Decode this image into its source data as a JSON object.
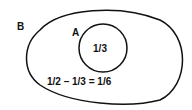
{
  "diagram": {
    "outer_set": {
      "label": "B"
    },
    "inner_set": {
      "label": "A",
      "value": "1/3"
    },
    "equation": "1/2 – 1/3 = 1/6"
  },
  "colors": {
    "stroke": "#111111",
    "background": "#ffffff"
  }
}
